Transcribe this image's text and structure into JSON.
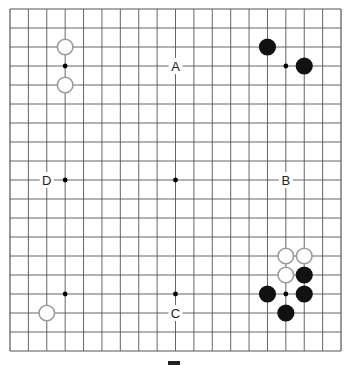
{
  "board": {
    "size": 19,
    "origin_x": 10,
    "origin_y": 9,
    "spacing_x": 18.39,
    "spacing_y": 19,
    "line_color": "#555555",
    "background": "#ffffff",
    "star_points": [
      [
        3,
        3
      ],
      [
        9,
        3
      ],
      [
        15,
        3
      ],
      [
        3,
        9
      ],
      [
        9,
        9
      ],
      [
        15,
        9
      ],
      [
        3,
        15
      ],
      [
        9,
        15
      ],
      [
        15,
        15
      ]
    ],
    "stones": [
      {
        "color": "white",
        "col": 3,
        "row": 2
      },
      {
        "color": "white",
        "col": 3,
        "row": 4
      },
      {
        "color": "black",
        "col": 14,
        "row": 2
      },
      {
        "color": "black",
        "col": 16,
        "row": 3
      },
      {
        "color": "white",
        "col": 15,
        "row": 13
      },
      {
        "color": "white",
        "col": 16,
        "row": 13
      },
      {
        "color": "white",
        "col": 15,
        "row": 14
      },
      {
        "color": "black",
        "col": 16,
        "row": 14
      },
      {
        "color": "black",
        "col": 14,
        "row": 15
      },
      {
        "color": "black",
        "col": 16,
        "row": 15
      },
      {
        "color": "black",
        "col": 15,
        "row": 16
      },
      {
        "color": "white",
        "col": 2,
        "row": 16
      }
    ],
    "labels": [
      {
        "text": "A",
        "col": 9,
        "row": 3
      },
      {
        "text": "B",
        "col": 15,
        "row": 9
      },
      {
        "text": "C",
        "col": 9,
        "row": 16
      },
      {
        "text": "D",
        "col": 2,
        "row": 9
      }
    ]
  },
  "colors": {
    "black_stone": "#111111",
    "white_stone_fill": "#ffffff",
    "white_stone_border": "#9a9a9a",
    "star_point": "#000000"
  }
}
